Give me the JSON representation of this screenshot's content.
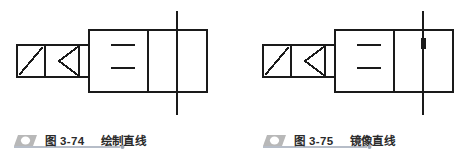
{
  "page": {
    "background_color": "#ffffff",
    "ink_color": "#1a1a1a",
    "caption_text_color": "#2b2b2b",
    "caption_icon_fill": "#b8b8b8",
    "caption_rule_color": "#6f7d91"
  },
  "figures": [
    {
      "id": "figure-3-74",
      "caption_icon": "parallelogram-bullet-icon",
      "caption_label": "图 3-74",
      "caption_title": "绘制直线",
      "drawing": {
        "name": "directional-control-valve-symbol",
        "description": "两位两通阀符号，带竖直直线",
        "has_grip_marker": false,
        "parts": [
          "actuator-box-with-diagonal",
          "arrow-triangle",
          "connector-stub",
          "valve-body-left-cell",
          "valve-body-middle-cell",
          "valve-body-right-cell",
          "spring-plates",
          "vertical-line"
        ]
      }
    },
    {
      "id": "figure-3-75",
      "caption_icon": "parallelogram-bullet-icon",
      "caption_label": "图 3-75",
      "caption_title": "镜像直线",
      "drawing": {
        "name": "directional-control-valve-symbol-mirrored",
        "description": "两位两通阀符号，竖直直线上带夹点标记",
        "has_grip_marker": true,
        "parts": [
          "actuator-box-with-diagonal",
          "arrow-triangle",
          "connector-stub",
          "valve-body-left-cell",
          "valve-body-middle-cell",
          "valve-body-right-cell",
          "spring-plates",
          "vertical-line",
          "grip-marker"
        ]
      }
    }
  ]
}
